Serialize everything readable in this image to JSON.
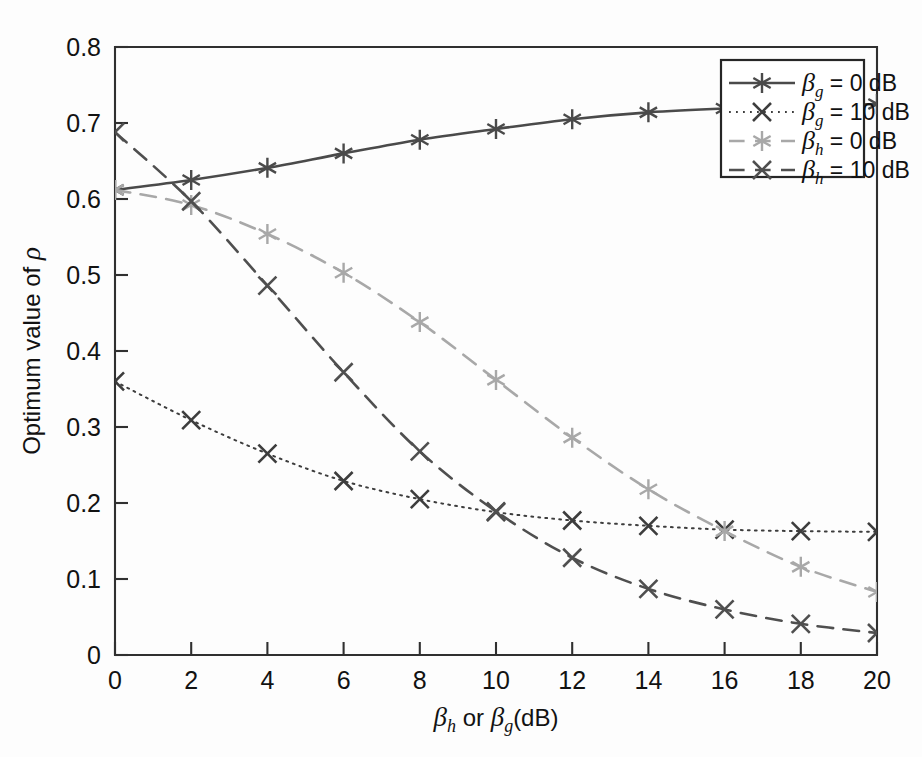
{
  "figure": {
    "background_color": "#fdfdfd",
    "frame_color": "#303030"
  },
  "chart_data": {
    "type": "line",
    "title": "",
    "subtitle": "",
    "xlabel": "βh or βg (dB)",
    "ylabel": "Optimum value of ρ",
    "xlim": [
      0,
      20
    ],
    "ylim": [
      0,
      0.8
    ],
    "grid": false,
    "legend_position": "top-right",
    "xticks": [
      "0",
      "2",
      "4",
      "6",
      "8",
      "10",
      "12",
      "14",
      "16",
      "18",
      "20"
    ],
    "xtick_values": [
      0,
      2,
      4,
      6,
      8,
      10,
      12,
      14,
      16,
      18,
      20
    ],
    "yticks": [
      "0",
      "0.1",
      "0.2",
      "0.3",
      "0.4",
      "0.5",
      "0.6",
      "0.7",
      "0.8"
    ],
    "ytick_values": [
      0,
      0.1,
      0.2,
      0.3,
      0.4,
      0.5,
      0.6,
      0.7,
      0.8
    ],
    "x": [
      0,
      2,
      4,
      6,
      8,
      10,
      12,
      14,
      16,
      18,
      20
    ],
    "series": [
      {
        "name": "βg = 0 dB",
        "key": "beta-g-0db",
        "color": "#4a4a4a",
        "linestyle": "solid",
        "marker": "asterisk",
        "values": [
          0.612,
          0.625,
          0.641,
          0.66,
          0.678,
          0.692,
          0.705,
          0.714,
          0.719,
          0.722,
          0.725
        ]
      },
      {
        "name": "βg = 10 dB",
        "key": "beta-g-10db",
        "color": "#3d3d3d",
        "linestyle": "dotted",
        "marker": "x",
        "values": [
          0.36,
          0.309,
          0.265,
          0.229,
          0.205,
          0.188,
          0.177,
          0.17,
          0.165,
          0.163,
          0.162
        ]
      },
      {
        "name": "βh = 0 dB",
        "key": "beta-h-0db",
        "color": "#a8a8a8",
        "linestyle": "dashed",
        "marker": "asterisk",
        "values": [
          0.612,
          0.592,
          0.554,
          0.503,
          0.438,
          0.362,
          0.286,
          0.218,
          0.163,
          0.116,
          0.083
        ]
      },
      {
        "name": "βh = 10 dB",
        "key": "beta-h-10db",
        "color": "#4f4f4f",
        "linestyle": "dashed",
        "marker": "x",
        "values": [
          0.688,
          0.597,
          0.486,
          0.372,
          0.268,
          0.189,
          0.128,
          0.087,
          0.06,
          0.041,
          0.029
        ]
      }
    ],
    "legend_entries": [
      {
        "label_base": "β",
        "label_sub": "g",
        "label_rest": "= 0 dB",
        "linestyle": "solid",
        "marker": "asterisk",
        "color": "#4a4a4a"
      },
      {
        "label_base": "β",
        "label_sub": "g",
        "label_rest": "= 10 dB",
        "linestyle": "dotted",
        "marker": "x",
        "color": "#3d3d3d"
      },
      {
        "label_base": "β",
        "label_sub": "h",
        "label_rest": "= 0 dB",
        "linestyle": "dashed",
        "marker": "asterisk",
        "color": "#a8a8a8"
      },
      {
        "label_base": "β",
        "label_sub": "h",
        "label_rest": "= 10 dB",
        "linestyle": "dashed",
        "marker": "x",
        "color": "#4f4f4f"
      }
    ],
    "ylabel_parts": {
      "text": "Optimum value of ",
      "symbol": "ρ"
    },
    "xlabel_parts": {
      "beta": "β",
      "sub_h": "h",
      "or": " or ",
      "sub_g": "g",
      "unit": "(dB)"
    }
  }
}
